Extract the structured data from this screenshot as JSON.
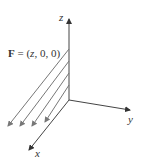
{
  "figure": {
    "field_label": {
      "bold": "F",
      "rest_prefix": " = (",
      "var": "z",
      "rest_suffix": ", 0, 0)"
    },
    "axes": {
      "z": "z",
      "y": "y",
      "x": "x"
    },
    "colors": {
      "axis": "#444444",
      "field_arrows": "#777777",
      "text": "#333333"
    },
    "field_arrow_count": 5
  }
}
